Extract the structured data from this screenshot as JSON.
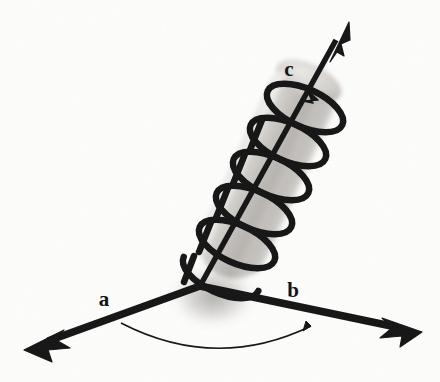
{
  "figure": {
    "background_color": "#fdfdfc",
    "ink_color": "#111111",
    "cylinder_light_color": "#e2e0dd",
    "cylinder_mid_color": "#c9c6c2",
    "cylinder_dark_color": "#a9a6a2"
  },
  "labels": {
    "vector_a": "a",
    "vector_b": "b",
    "vector_c": "c"
  },
  "geometry": {
    "origin": {
      "x": 200,
      "y": 286
    },
    "vector_a_tip": {
      "x": 28,
      "y": 348
    },
    "vector_b_tip": {
      "x": 420,
      "y": 330
    },
    "vector_c_tip": {
      "x": 348,
      "y": 24
    },
    "label_a_pos": {
      "x": 104,
      "y": 305
    },
    "label_b_pos": {
      "x": 292,
      "y": 296
    },
    "label_c_pos": {
      "x": 288,
      "y": 74
    },
    "arc_start": {
      "x": 120,
      "y": 324
    },
    "arc_end": {
      "x": 312,
      "y": 327
    },
    "helix_turns": 6
  },
  "elements": {
    "vector_a_name": "vector-a-arrow",
    "vector_b_name": "vector-b-arrow",
    "vector_c_name": "vector-c-arrow",
    "cylinder_name": "shaded-cylinder",
    "helix_name": "helix-coil",
    "rotation_arrow_name": "rotation-arrowhead",
    "angle_arc_name": "angle-arc"
  }
}
